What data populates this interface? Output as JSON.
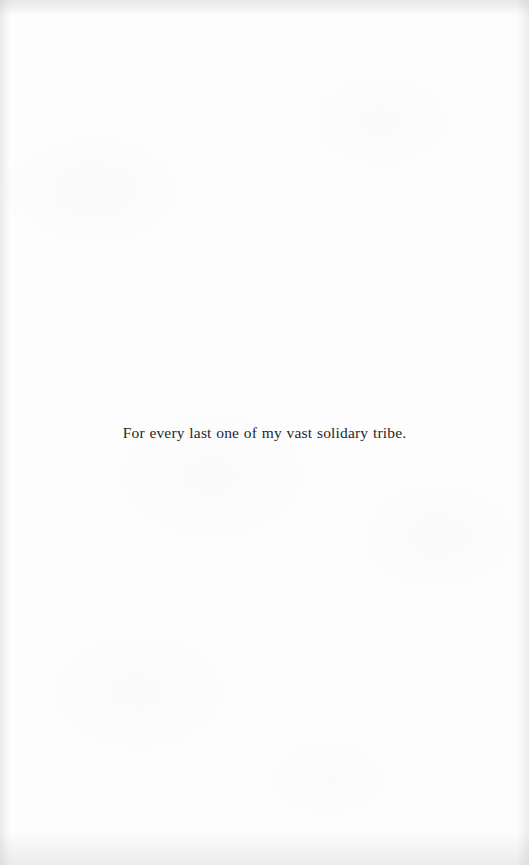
{
  "page": {
    "kind": "book-dedication-page",
    "paper_color": "#fdfdfd",
    "ink_color": "#26262a"
  },
  "dedication": {
    "text": "For every last one of my vast solidary tribe."
  }
}
